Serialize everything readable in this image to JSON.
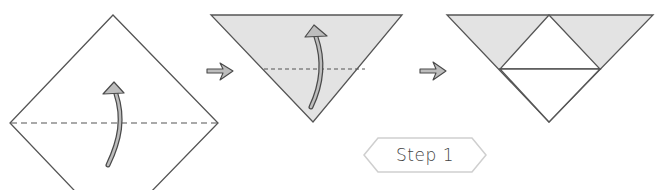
{
  "diagram": {
    "type": "origami-instructions",
    "step_label": "Step 1",
    "colors": {
      "paper_fill": "#ffffff",
      "colored_side": "#e3e3e3",
      "line": "#555555",
      "arrow_fill": "#bdbdbd",
      "arrow_stroke": "#4a4a4a",
      "badge_stroke": "#cfcfcf"
    },
    "figures": [
      {
        "id": "square-diamond",
        "description": "Square paper turned as diamond with horizontal dashed fold line and curved fold-up arrow"
      },
      {
        "id": "folded-triangle",
        "description": "Inverted triangle (colored side) with dashed horizontal fold line and curved fold-up arrow"
      },
      {
        "id": "result-triangle",
        "description": "Inverted triangle showing white center triangle folded up, with colored corners"
      }
    ],
    "transitions": [
      "right-arrow-icon",
      "right-arrow-icon"
    ]
  }
}
